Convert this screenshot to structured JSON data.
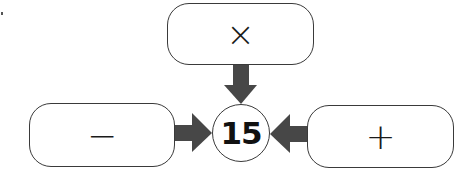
{
  "diagram": {
    "center": {
      "value": "15"
    },
    "boxes": [
      {
        "id": "top",
        "operator": "×",
        "operator_name": "multiplication"
      },
      {
        "id": "left",
        "operator": "−",
        "operator_name": "subtraction"
      },
      {
        "id": "right",
        "operator": "+",
        "operator_name": "addition"
      }
    ],
    "arrow_color": "#474747",
    "border_color": "#3a3a3a"
  }
}
